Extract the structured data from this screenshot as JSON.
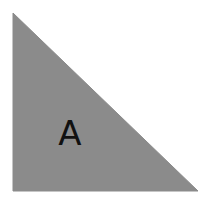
{
  "diagram": {
    "shape": "right-triangle",
    "fill_color": "#8b8b8b",
    "background_color": "#ffffff",
    "label": "A",
    "label_color": "#111111"
  }
}
